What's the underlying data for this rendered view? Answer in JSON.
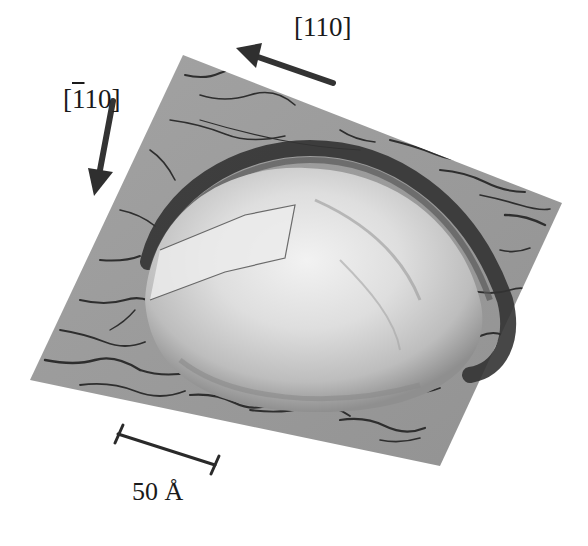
{
  "figure": {
    "direction_labels": {
      "primary": "[110]",
      "secondary_prefix": "[",
      "secondary_bar_digit": "1",
      "secondary_suffix": "10]"
    },
    "scale_bar": {
      "label": "50 Å",
      "length_value": 50,
      "unit": "Å"
    },
    "colors": {
      "background": "#ffffff",
      "substrate": "#9a9a9a",
      "substrate_texture": "#2b2b2b",
      "dome_highlight": "#e8e8e8",
      "dome_ring": "#3a3a3a",
      "arrow": "#333333",
      "text": "#1a1a1a"
    }
  }
}
